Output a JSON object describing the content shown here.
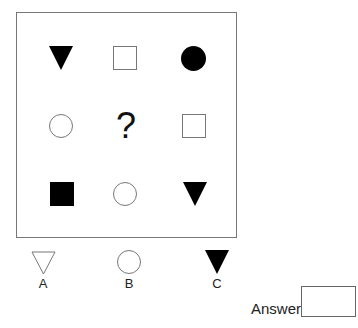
{
  "question_label": "?",
  "grid": {
    "rows": [
      [
        {
          "shape": "triangle-down",
          "fill": "filled"
        },
        {
          "shape": "square",
          "fill": "outline"
        },
        {
          "shape": "circle",
          "fill": "filled"
        }
      ],
      [
        {
          "shape": "circle",
          "fill": "outline"
        },
        {
          "shape": "missing",
          "fill": "none"
        },
        {
          "shape": "square",
          "fill": "outline"
        }
      ],
      [
        {
          "shape": "square",
          "fill": "filled"
        },
        {
          "shape": "circle",
          "fill": "outline"
        },
        {
          "shape": "triangle-down",
          "fill": "filled"
        }
      ]
    ]
  },
  "options": [
    {
      "label": "A",
      "shape": "triangle-down",
      "fill": "outline"
    },
    {
      "label": "B",
      "shape": "circle",
      "fill": "outline"
    },
    {
      "label": "C",
      "shape": "triangle-down",
      "fill": "filled"
    }
  ],
  "answer": {
    "label": "Answer",
    "value": ""
  },
  "colors": {
    "fill": "#000000",
    "outline": "#777777"
  }
}
